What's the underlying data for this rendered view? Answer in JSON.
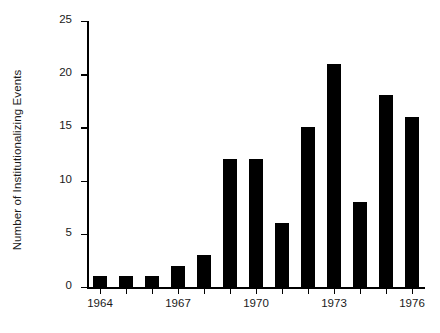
{
  "chart_data": {
    "type": "bar",
    "title": "",
    "xlabel": "",
    "ylabel": "Number of Institutionalizing Events",
    "categories": [
      1964,
      1965,
      1966,
      1967,
      1968,
      1969,
      1970,
      1971,
      1972,
      1973,
      1974,
      1975,
      1976
    ],
    "values": [
      1,
      1,
      1,
      2,
      3,
      12,
      12,
      6,
      15,
      21,
      8,
      18,
      16
    ],
    "series": [
      {
        "name": "Institutionalizing Events",
        "values": [
          1,
          1,
          1,
          2,
          3,
          12,
          12,
          6,
          15,
          21,
          8,
          18,
          16
        ]
      }
    ],
    "ylim": [
      0,
      25
    ],
    "ytick_values": [
      0,
      5,
      10,
      15,
      20,
      25
    ],
    "ytick_labels": [
      "0",
      "5",
      "10",
      "15",
      "20",
      "25"
    ],
    "xtick_values": [
      1964,
      1965,
      1966,
      1967,
      1968,
      1969,
      1970,
      1971,
      1972,
      1973,
      1974,
      1975,
      1976
    ],
    "xtick_labels": [
      "1964",
      "",
      "",
      "1967",
      "",
      "",
      "1970",
      "",
      "",
      "1973",
      "",
      "",
      "1976"
    ],
    "grid": false,
    "legend": false,
    "legend_position": "none",
    "bar_color": "#000000",
    "axis_color": "#000000",
    "background_color": "#ffffff",
    "annotations": []
  }
}
